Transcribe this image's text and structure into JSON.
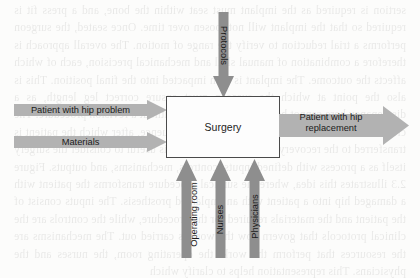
{
  "page": {
    "background_text": "sertion is required as the implant must seat within the bone, and a press fit is required so that the implant will not loosen over time. Once seated, the surgeon performs a trial reduction to verify the range of motion. The overall approach is therefore a combination of manual skill and mechanical precision, each of which affects the outcome. The implant is then impacted into the final position. This is also the point at which the surgeon must ensure correct leg length, as a discrepancy here cannot be corrected afterward without a revision procedure. The closure of the wound completes the operative sequence, after which the patient is transferred to the recovery unit for monitoring. It is useful to consider the surgery itself as a process with defined inputs, controls, mechanisms, and outputs. Figure 2.3 illustrates this idea, where the surgical procedure transforms the patient with a damaged hip into a patient with an implanted prosthesis. The inputs consist of the patient and the materials required for the procedure, while the controls are the clinical protocols that govern how the work is carried out. The mechanisms are the resources that perform the work: the operating room, the nurses and the physicians. This representation helps to clarify which"
  },
  "diagram": {
    "type": "idef0-process-diagram",
    "process": {
      "label": "Surgery"
    },
    "inputs": [
      {
        "label": "Patient with hip problem",
        "direction": "right",
        "side": "left"
      },
      {
        "label": "Materials",
        "direction": "right",
        "side": "left"
      }
    ],
    "outputs": [
      {
        "label": "Patient with hip replacement",
        "direction": "right",
        "side": "right"
      }
    ],
    "controls": [
      {
        "label": "Protocols",
        "direction": "down",
        "side": "top"
      }
    ],
    "mechanisms": [
      {
        "label": "Operating room",
        "direction": "up",
        "side": "bottom"
      },
      {
        "label": "Nurses",
        "direction": "up",
        "side": "bottom"
      },
      {
        "label": "Physicians",
        "direction": "up",
        "side": "bottom"
      }
    ],
    "colors": {
      "arrow_horizontal_fill": "#b2b2b2",
      "arrow_vertical_fill": "#8e8e8e",
      "box_border": "#4a4a4a",
      "box_fill": "#fdfdfd",
      "text": "#1a1a1a",
      "page_background": "#fcfcfb"
    }
  }
}
